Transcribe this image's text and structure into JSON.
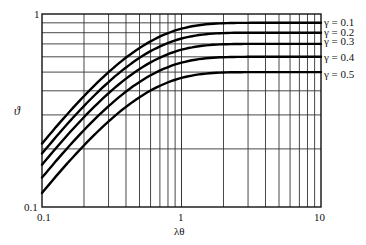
{
  "chart_data": {
    "type": "line",
    "title": "",
    "xlabel": "λθ",
    "ylabel": "ϑ",
    "xscale": "log",
    "yscale": "log",
    "xlim": [
      0.1,
      10
    ],
    "ylim": [
      0.1,
      1
    ],
    "grid": true,
    "legend_position": "right, inline at curve ends",
    "x_tick_labels": [
      "0.1",
      "1",
      "10"
    ],
    "y_tick_labels": [
      "0.1",
      "1"
    ],
    "x": [
      0.1,
      0.2,
      0.3,
      0.5,
      0.7,
      1,
      1.5,
      2,
      3,
      5,
      7,
      10
    ],
    "series": [
      {
        "name": "γ = 0.1",
        "gamma": 0.1,
        "values": [
          0.22,
          0.38,
          0.5,
          0.67,
          0.77,
          0.84,
          0.88,
          0.9,
          0.9,
          0.9,
          0.9,
          0.9
        ]
      },
      {
        "name": "γ = 0.2",
        "gamma": 0.2,
        "values": [
          0.17,
          0.3,
          0.41,
          0.56,
          0.65,
          0.73,
          0.78,
          0.8,
          0.81,
          0.82,
          0.82,
          0.82
        ]
      },
      {
        "name": "γ = 0.3",
        "gamma": 0.3,
        "values": [
          0.14,
          0.24,
          0.33,
          0.46,
          0.55,
          0.62,
          0.67,
          0.69,
          0.7,
          0.7,
          0.7,
          0.7
        ]
      },
      {
        "name": "γ = 0.4",
        "gamma": 0.4,
        "values": [
          0.11,
          0.2,
          0.27,
          0.38,
          0.46,
          0.52,
          0.56,
          0.58,
          0.59,
          0.59,
          0.59,
          0.59
        ]
      },
      {
        "name": "γ = 0.5",
        "gamma": 0.5,
        "values": [
          0.09,
          0.16,
          0.22,
          0.31,
          0.37,
          0.42,
          0.45,
          0.46,
          0.47,
          0.47,
          0.47,
          0.47
        ]
      }
    ]
  },
  "labels": {
    "y_axis": "ϑ",
    "x_axis": "λθ",
    "y_top": "1",
    "y_bottom": "0.1",
    "x_left": "0.1",
    "x_mid": "1",
    "x_right": "10",
    "legend": [
      "γ = 0.1",
      "γ = 0.2",
      "γ = 0.3",
      "γ = 0.4",
      "γ = 0.5"
    ]
  }
}
